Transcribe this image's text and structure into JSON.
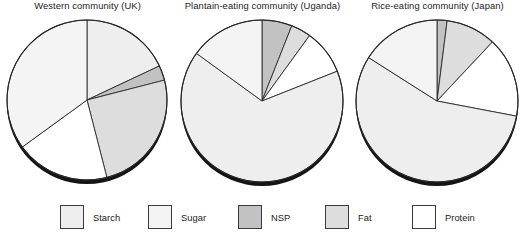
{
  "figure": {
    "caption": "",
    "background": "#ffffff"
  },
  "legend": {
    "position": "bottom",
    "items": [
      {
        "label": "Starch",
        "color": "#eeeeee",
        "x": 60
      },
      {
        "label": "Sugar",
        "color": "#f4f4f4",
        "x": 148
      },
      {
        "label": "NSP",
        "color": "#c2c2c2",
        "x": 238
      },
      {
        "label": "Fat",
        "color": "#dddddd",
        "x": 325
      },
      {
        "label": "Protein",
        "color": "#ffffff",
        "x": 412
      }
    ]
  },
  "chart_data": [
    {
      "type": "pie",
      "title": "Western community (UK)",
      "xlabel": "",
      "ylabel": "",
      "labels": [
        "Starch",
        "NSP",
        "Fat",
        "Protein",
        "Sugar"
      ],
      "values": [
        18,
        3,
        25,
        19,
        35
      ],
      "colors": [
        "#eeeeee",
        "#c2c2c2",
        "#dddddd",
        "#ffffff",
        "#f4f4f4"
      ],
      "start_angle_deg": 0,
      "center": {
        "x": 87,
        "y": 100
      },
      "radius": 80,
      "annotations": []
    },
    {
      "type": "pie",
      "title": "Plantain-eating community (Uganda)",
      "xlabel": "",
      "ylabel": "",
      "labels": [
        "NSP",
        "Fat",
        "Protein",
        "Starch",
        "Sugar"
      ],
      "values": [
        6,
        4,
        9,
        66,
        15
      ],
      "colors": [
        "#c2c2c2",
        "#dddddd",
        "#ffffff",
        "#eeeeee",
        "#f4f4f4"
      ],
      "start_angle_deg": 0,
      "center": {
        "x": 262,
        "y": 101
      },
      "radius": 81,
      "annotations": []
    },
    {
      "type": "pie",
      "title": "Rice-eating community (Japan)",
      "xlabel": "",
      "ylabel": "",
      "labels": [
        "NSP",
        "Fat",
        "Protein",
        "Starch",
        "Sugar"
      ],
      "values": [
        2,
        10,
        16,
        56,
        16
      ],
      "colors": [
        "#c2c2c2",
        "#dddddd",
        "#ffffff",
        "#eeeeee",
        "#f4f4f4"
      ],
      "start_angle_deg": 0,
      "center": {
        "x": 437,
        "y": 101
      },
      "radius": 81,
      "annotations": []
    }
  ]
}
